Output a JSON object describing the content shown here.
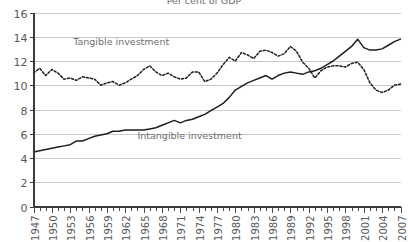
{
  "chart_data": {
    "type": "line",
    "title": "Per cent of GDP",
    "xlabel": "",
    "ylabel": "",
    "ylim": [
      0,
      16
    ],
    "yticks": [
      0,
      2,
      4,
      6,
      8,
      10,
      12,
      14,
      16
    ],
    "ytick_labels": [
      "0",
      "2",
      "4",
      "6",
      "8",
      "10",
      "12",
      "14",
      "16"
    ],
    "xlim": [
      1947,
      2007
    ],
    "xtick_labels": [
      "1947",
      "1950",
      "1953",
      "1956",
      "1959",
      "1962",
      "1965",
      "1968",
      "1971",
      "1974",
      "1977",
      "1980",
      "1983",
      "1986",
      "1989",
      "1992",
      "1995",
      "1998",
      "2001",
      "2004",
      "2007"
    ],
    "xtick_step_labeled": 3,
    "xtick_step_minor": 1,
    "grid": "horizontal",
    "legend_position": "inline-annotations",
    "annotations": [
      {
        "text": "Tangible investment",
        "x": 1953.5,
        "y": 13.3
      },
      {
        "text": "Intangible investment",
        "x": 1964.0,
        "y": 5.6
      }
    ],
    "x": [
      1947,
      1948,
      1949,
      1950,
      1951,
      1952,
      1953,
      1954,
      1955,
      1956,
      1957,
      1958,
      1959,
      1960,
      1961,
      1962,
      1963,
      1964,
      1965,
      1966,
      1967,
      1968,
      1969,
      1970,
      1971,
      1972,
      1973,
      1974,
      1975,
      1976,
      1977,
      1978,
      1979,
      1980,
      1981,
      1982,
      1983,
      1984,
      1985,
      1986,
      1987,
      1988,
      1989,
      1990,
      1991,
      1992,
      1993,
      1994,
      1995,
      1996,
      1997,
      1998,
      1999,
      2000,
      2001,
      2002,
      2003,
      2004,
      2005,
      2006,
      2007
    ],
    "series": [
      {
        "name": "Tangible investment",
        "style": "dotted",
        "color": "#1d1d1d",
        "values": [
          11.0,
          11.4,
          10.8,
          11.3,
          11.0,
          10.5,
          10.6,
          10.4,
          10.7,
          10.6,
          10.5,
          10.0,
          10.2,
          10.3,
          10.0,
          10.2,
          10.5,
          10.8,
          11.3,
          11.6,
          11.1,
          10.8,
          11.0,
          10.7,
          10.5,
          10.6,
          11.1,
          11.1,
          10.3,
          10.5,
          11.0,
          11.7,
          12.3,
          12.0,
          12.7,
          12.5,
          12.2,
          12.8,
          12.9,
          12.7,
          12.4,
          12.6,
          13.2,
          12.8,
          11.9,
          11.4,
          10.6,
          11.2,
          11.5,
          11.6,
          11.6,
          11.5,
          11.8,
          11.9,
          11.3,
          10.2,
          9.6,
          9.4,
          9.6,
          10.0,
          10.1
        ]
      },
      {
        "name": "Intangible investment",
        "style": "solid",
        "color": "#1d1d1d",
        "values": [
          4.5,
          4.6,
          4.7,
          4.8,
          4.9,
          5.0,
          5.1,
          5.4,
          5.4,
          5.6,
          5.8,
          5.9,
          6.0,
          6.2,
          6.2,
          6.3,
          6.3,
          6.3,
          6.3,
          6.4,
          6.5,
          6.7,
          6.9,
          7.1,
          6.9,
          7.1,
          7.2,
          7.4,
          7.6,
          7.9,
          8.2,
          8.5,
          9.0,
          9.6,
          9.9,
          10.2,
          10.4,
          10.6,
          10.8,
          10.5,
          10.8,
          11.0,
          11.1,
          11.0,
          10.9,
          11.1,
          11.2,
          11.4,
          11.7,
          12.0,
          12.4,
          12.8,
          13.2,
          13.8,
          13.1,
          12.9,
          12.9,
          13.0,
          13.3,
          13.6,
          13.8
        ]
      }
    ]
  }
}
